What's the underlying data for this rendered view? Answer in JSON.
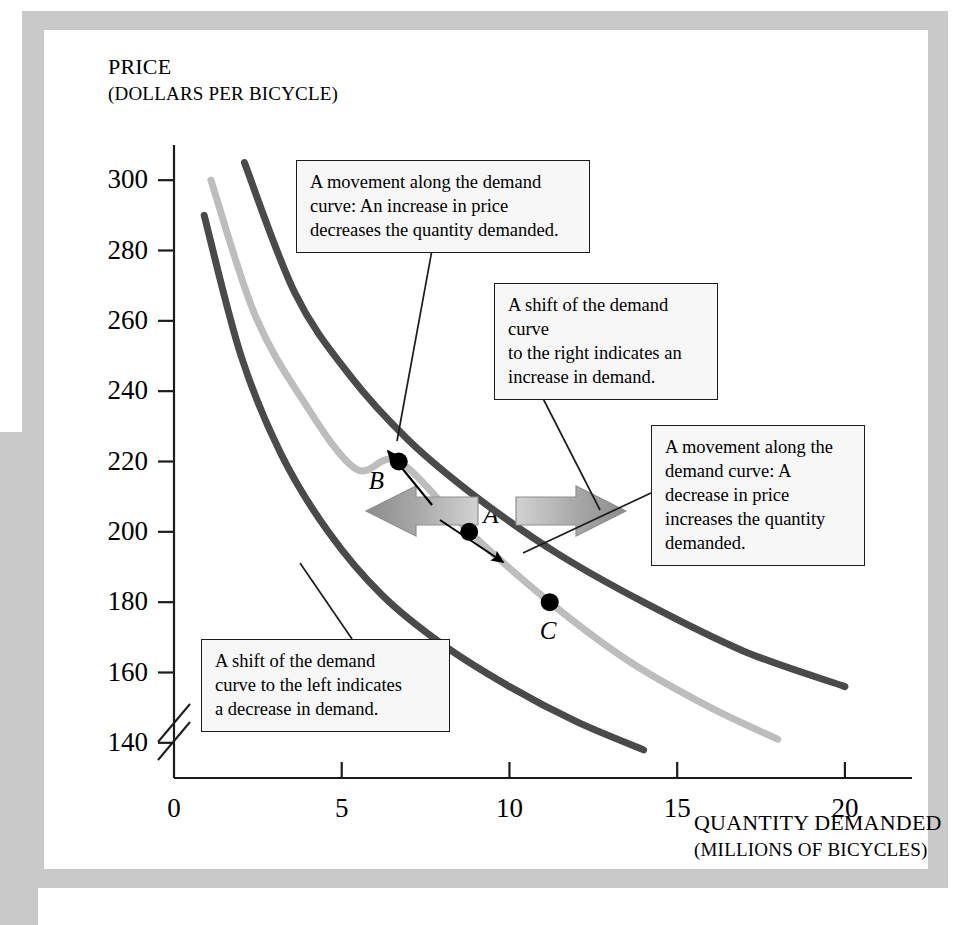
{
  "figure": {
    "frame_color": "#c9c9c9",
    "background_color": "#ffffff"
  },
  "chart_data": {
    "type": "line",
    "title": "",
    "xlabel": "QUANTITY DEMANDED",
    "xlabel_sub": "(MILLIONS OF BICYCLES)",
    "ylabel": "PRICE",
    "ylabel_sub": "(DOLLARS PER BICYCLE)",
    "xlim": [
      0,
      22
    ],
    "ylim": [
      130,
      310
    ],
    "y_axis_break": true,
    "grid": false,
    "legend": "none",
    "xticks": [
      0,
      5,
      10,
      15,
      20
    ],
    "xtick_labels": [
      "0",
      "5",
      "10",
      "15",
      "20"
    ],
    "yticks": [
      140,
      160,
      180,
      200,
      220,
      240,
      260,
      280,
      300
    ],
    "ytick_labels": [
      "140",
      "160",
      "180",
      "200",
      "220",
      "240",
      "260",
      "280",
      "300"
    ],
    "series": [
      {
        "name": "Demand curve shifted left (decrease in demand)",
        "color": "#4a4a4a",
        "linewidth": 7,
        "x": [
          0.9,
          2.0,
          3.2,
          4.6,
          6.2,
          8.0,
          10.0,
          12.0,
          14.0
        ],
        "y": [
          290,
          250,
          222,
          200,
          182,
          168,
          156,
          146,
          138
        ]
      },
      {
        "name": "Original demand curve",
        "color": "#bdbdbd",
        "linewidth": 7,
        "x": [
          1.1,
          2.4,
          3.8,
          5.4,
          6.7,
          8.8,
          11.2,
          13.6,
          16.0,
          18.0
        ],
        "y": [
          300,
          262,
          238,
          218,
          220,
          200,
          180,
          163,
          150,
          141
        ]
      },
      {
        "name": "Demand curve shifted right (increase in demand)",
        "color": "#4a4a4a",
        "linewidth": 7,
        "x": [
          2.1,
          3.6,
          5.2,
          7.0,
          9.0,
          11.4,
          14.0,
          17.0,
          20.0
        ],
        "y": [
          305,
          268,
          245,
          226,
          210,
          194,
          180,
          166,
          156
        ]
      }
    ],
    "points": [
      {
        "label": "A",
        "x": 8.8,
        "y": 200
      },
      {
        "label": "B",
        "x": 6.7,
        "y": 220
      },
      {
        "label": "C",
        "x": 11.2,
        "y": 180
      }
    ],
    "annotations": [
      {
        "id": "movement-up",
        "text": "A movement along the demand curve: An increase in price decreases the quantity demanded.",
        "lines": [
          "A movement along the demand",
          "curve: An increase in price",
          "decreases the quantity demanded."
        ],
        "points_to": "B"
      },
      {
        "id": "shift-right",
        "text": "A shift of the demand curve to the right indicates an increase in demand.",
        "lines": [
          "A shift of the demand curve",
          "to the right indicates an",
          "increase in demand."
        ],
        "points_to": "right-shift-arrow"
      },
      {
        "id": "movement-down",
        "text": "A movement along the demand curve: A decrease in price increases the quantity demanded.",
        "lines": [
          "A movement along the",
          "demand curve: A",
          "decrease in price",
          "increases the quantity",
          "demanded."
        ],
        "points_to": "C"
      },
      {
        "id": "shift-left",
        "text": "A shift of the demand curve to the left indicates a decrease in demand.",
        "lines": [
          "A shift of the demand",
          "curve to the left indicates",
          "a decrease in demand."
        ],
        "points_to": "left-shift-arrow"
      }
    ],
    "shift_arrows": [
      {
        "id": "left-shift-arrow",
        "direction": "left",
        "color": "#9a9a9a",
        "meaning": "decrease in demand"
      },
      {
        "id": "right-shift-arrow",
        "direction": "right",
        "color": "#9a9a9a",
        "meaning": "increase in demand"
      }
    ],
    "movement_arrows": [
      {
        "id": "arrow-a-to-b",
        "from": "A",
        "to": "B",
        "color": "#000000"
      },
      {
        "id": "arrow-a-to-c",
        "from": "A",
        "to": "C",
        "color": "#000000"
      }
    ]
  }
}
